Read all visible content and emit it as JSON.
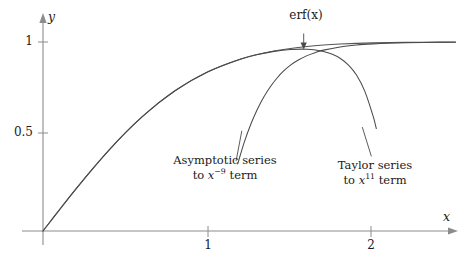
{
  "chart_data": {
    "type": "line",
    "title": "",
    "xlabel": "x",
    "ylabel": "y",
    "xlim": [
      0,
      2.55
    ],
    "ylim": [
      0,
      1.09
    ],
    "grid": false,
    "legend": "annotations-inline",
    "xticks": [
      {
        "value": 1,
        "label": "1"
      },
      {
        "value": 2,
        "label": "2"
      }
    ],
    "yticks": [
      {
        "value": 0.5,
        "label": "0.5"
      },
      {
        "value": 1,
        "label": "1"
      }
    ],
    "series": [
      {
        "name": "erf(x)",
        "label": "erf(x)",
        "color": "#555555",
        "x": [
          0,
          0.1,
          0.2,
          0.3,
          0.4,
          0.5,
          0.6,
          0.7,
          0.8,
          0.9,
          1.0,
          1.1,
          1.2,
          1.3,
          1.4,
          1.5,
          1.6,
          1.7,
          1.8,
          1.9,
          2.0,
          2.1,
          2.2,
          2.3,
          2.4,
          2.5
        ],
        "values": [
          0,
          0.1125,
          0.2227,
          0.3286,
          0.4284,
          0.5205,
          0.6039,
          0.6778,
          0.7421,
          0.7969,
          0.8427,
          0.8802,
          0.9103,
          0.934,
          0.9523,
          0.9661,
          0.9763,
          0.9838,
          0.9891,
          0.9928,
          0.9953,
          0.997,
          0.9981,
          0.9989,
          0.9993,
          0.9996
        ]
      },
      {
        "name": "asymptotic-series",
        "label": "Asymptotic series to x^-9 term",
        "color": "#4a4a4a",
        "x": [
          1.18,
          1.22,
          1.26,
          1.3,
          1.34,
          1.38,
          1.42,
          1.46,
          1.5,
          1.55,
          1.6,
          1.65,
          1.7,
          1.8,
          1.9,
          2.0,
          2.1,
          2.2,
          2.3,
          2.4,
          2.5
        ],
        "values": [
          0.355,
          0.47,
          0.566,
          0.646,
          0.712,
          0.766,
          0.811,
          0.848,
          0.878,
          0.906,
          0.928,
          0.944,
          0.957,
          0.974,
          0.984,
          0.99,
          0.9938,
          0.9961,
          0.9976,
          0.9985,
          0.9991
        ]
      },
      {
        "name": "taylor-series",
        "label": "Taylor series to x^11 term",
        "color": "#4a4a4a",
        "x": [
          0,
          0.2,
          0.4,
          0.6,
          0.8,
          1.0,
          1.2,
          1.3,
          1.4,
          1.5,
          1.6,
          1.65,
          1.7,
          1.75,
          1.8,
          1.85,
          1.9,
          1.95,
          2.0,
          2.02
        ],
        "values": [
          0,
          0.2227,
          0.4284,
          0.6039,
          0.7421,
          0.8427,
          0.9103,
          0.9335,
          0.9505,
          0.9605,
          0.962,
          0.958,
          0.95,
          0.936,
          0.914,
          0.879,
          0.825,
          0.74,
          0.61,
          0.542
        ]
      }
    ],
    "annotations": [
      {
        "name": "erf-label",
        "text": "erf(x)",
        "math_text": "erf(x)",
        "arrow": true,
        "arrow_from": {
          "x": 1.58,
          "y": 1.045
        },
        "arrow_to": {
          "x": 1.58,
          "y": 0.965
        }
      },
      {
        "name": "asymptotic-label",
        "line1": "Asymptotic series",
        "line2_pre": "to ",
        "line2_var": "x",
        "line2_sup": "−9",
        "line2_post": " term",
        "leader_from": {
          "x": 1.205,
          "y": 0.53
        },
        "leader_to": {
          "x": 1.17,
          "y": 0.37
        }
      },
      {
        "name": "taylor-label",
        "line1": "Taylor series",
        "line2_pre": "to ",
        "line2_var": "x",
        "line2_sup": "11",
        "line2_post": " term",
        "leader_from": {
          "x": 1.935,
          "y": 0.55
        },
        "leader_to": {
          "x": 1.99,
          "y": 0.395
        }
      }
    ],
    "axes": {
      "x_arrow_label": "x",
      "y_arrow_label": "y",
      "axis_color": "#8c8c8c"
    }
  }
}
